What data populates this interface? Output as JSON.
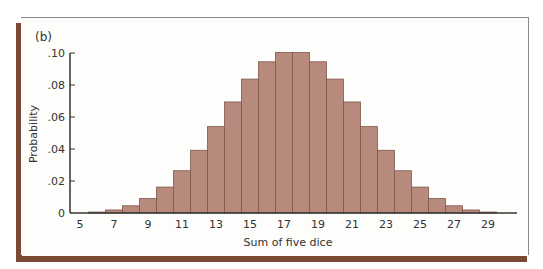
{
  "panel_label": "(b)",
  "colors": {
    "bar_fill": "#b78a7d",
    "bar_stroke": "#7e574b",
    "axis": "#333333",
    "frame_shadow": "#7b4a35"
  },
  "chart_data": {
    "type": "bar",
    "title": "",
    "panel": "(b)",
    "xlabel": "Sum of five dice",
    "ylabel": "Probability",
    "xlim": [
      5,
      30
    ],
    "ylim": [
      0,
      0.1
    ],
    "xticks": [
      "5",
      "7",
      "9",
      "11",
      "13",
      "15",
      "17",
      "19",
      "21",
      "23",
      "25",
      "27",
      "29"
    ],
    "yticks": [
      "0",
      ".02",
      ".04",
      ".06",
      ".08",
      ".10"
    ],
    "grid": false,
    "legend": null,
    "categories": [
      5,
      6,
      7,
      8,
      9,
      10,
      11,
      12,
      13,
      14,
      15,
      16,
      17,
      18,
      19,
      20,
      21,
      22,
      23,
      24,
      25,
      26,
      27,
      28,
      29,
      30
    ],
    "values": [
      0.0001,
      0.0006,
      0.0019,
      0.0045,
      0.009,
      0.0162,
      0.0264,
      0.0392,
      0.054,
      0.0694,
      0.0837,
      0.0945,
      0.1003,
      0.1003,
      0.0945,
      0.0837,
      0.0694,
      0.054,
      0.0392,
      0.0264,
      0.0162,
      0.009,
      0.0045,
      0.0019,
      0.0006,
      0.0001
    ]
  }
}
